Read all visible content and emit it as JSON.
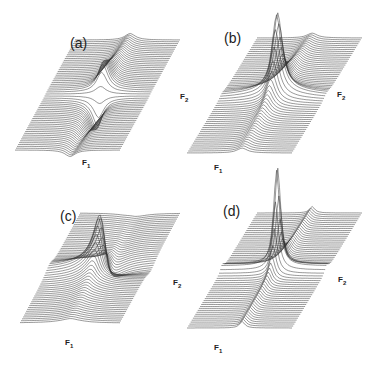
{
  "figure": {
    "type": "stacked-trace 3D surface plots",
    "panels": [
      {
        "id": "a",
        "label": "(a)",
        "axis_f1": "F",
        "axis_f1_sub": "1",
        "axis_f2": "F",
        "axis_f2_sub": "2",
        "shape": "dispersive-cross",
        "description": "peak with positive lobe upward and negative lobe downward, dispersive ridges along diagonal"
      },
      {
        "id": "b",
        "label": "(b)",
        "axis_f1": "F",
        "axis_f1_sub": "1",
        "axis_f2": "F",
        "axis_f2_sub": "2",
        "shape": "absorptive-ridge",
        "description": "single tall peak with long ridge tails along F1 and F2"
      },
      {
        "id": "c",
        "label": "(c)",
        "axis_f1": "F",
        "axis_f1_sub": "1",
        "axis_f2": "F",
        "axis_f2_sub": "2",
        "shape": "mixed-phase",
        "description": "peak and trough with strongly dispersive surface"
      },
      {
        "id": "d",
        "label": "(d)",
        "axis_f1": "F",
        "axis_f1_sub": "1",
        "axis_f2": "F",
        "axis_f2_sub": "2",
        "shape": "pure-absorption",
        "description": "sharp single tall absorptive peak with weak ridges"
      }
    ]
  }
}
